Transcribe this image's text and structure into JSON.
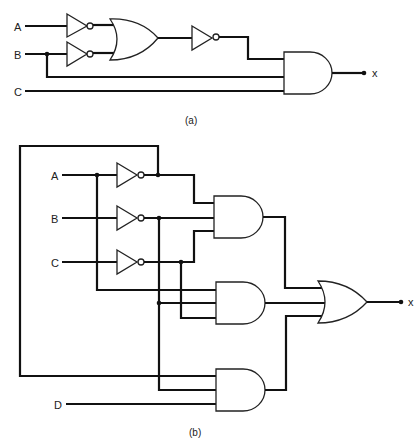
{
  "figure": {
    "part_a": {
      "caption": "(a)",
      "inputs": [
        {
          "name": "A",
          "label": "A"
        },
        {
          "name": "B",
          "label": "B"
        },
        {
          "name": "C",
          "label": "C"
        }
      ],
      "output": {
        "label": "x"
      },
      "gates": [
        {
          "id": "inv-a",
          "type": "NOT",
          "input": "A"
        },
        {
          "id": "inv-b",
          "type": "NOT",
          "input": "B"
        },
        {
          "id": "or-1",
          "type": "OR",
          "inputs": [
            "inv-a",
            "inv-b"
          ]
        },
        {
          "id": "inv-or",
          "type": "NOT",
          "input": "or-1"
        },
        {
          "id": "and-1",
          "type": "AND",
          "inputs": [
            "inv-or",
            "B",
            "C"
          ]
        }
      ]
    },
    "part_b": {
      "caption": "(b)",
      "inputs": [
        {
          "name": "A",
          "label": "A"
        },
        {
          "name": "B",
          "label": "B"
        },
        {
          "name": "C",
          "label": "C"
        },
        {
          "name": "D",
          "label": "D"
        }
      ],
      "output": {
        "label": "x"
      },
      "gates": [
        {
          "id": "inv-a",
          "type": "NOT",
          "input": "A"
        },
        {
          "id": "inv-b",
          "type": "NOT",
          "input": "B"
        },
        {
          "id": "inv-c",
          "type": "NOT",
          "input": "C"
        },
        {
          "id": "and-1",
          "type": "AND",
          "inputs": [
            "inv-a",
            "inv-b",
            "inv-c"
          ]
        },
        {
          "id": "and-2",
          "type": "AND",
          "inputs": [
            "A",
            "inv-b",
            "inv-c"
          ]
        },
        {
          "id": "and-3",
          "type": "AND",
          "inputs": [
            "inv-a",
            "inv-b",
            "D"
          ]
        },
        {
          "id": "or-1",
          "type": "OR",
          "inputs": [
            "and-1",
            "and-2",
            "and-3"
          ]
        }
      ]
    }
  },
  "colors": {
    "wire": "#111111",
    "gate_stroke": "#222222",
    "background": "#ffffff"
  }
}
